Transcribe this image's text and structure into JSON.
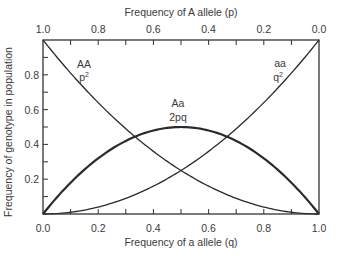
{
  "chart_data": {
    "type": "line",
    "title": "",
    "xlabel": "Frequency of a allele (q)",
    "x2label": "Frequency of A allele (p)",
    "ylabel": "Frequency of genotype in population",
    "xlim": [
      0,
      1
    ],
    "ylim": [
      0,
      1
    ],
    "x_ticks": [
      "0.0",
      "0.2",
      "0.4",
      "0.6",
      "0.8",
      "1.0"
    ],
    "x2_ticks": [
      "1.0",
      "0.8",
      "0.6",
      "0.4",
      "0.2",
      "0.0"
    ],
    "y_ticks": [
      "0.2",
      "0.4",
      "0.6",
      "0.8"
    ],
    "grid": false,
    "x": [
      0,
      0.1,
      0.2,
      0.3,
      0.4,
      0.5,
      0.6,
      0.7,
      0.8,
      0.9,
      1.0
    ],
    "series": [
      {
        "name": "AA p²",
        "label_top": "AA",
        "label_bottom": "p2",
        "values": [
          1.0,
          0.81,
          0.64,
          0.49,
          0.36,
          0.25,
          0.16,
          0.09,
          0.04,
          0.01,
          0.0
        ]
      },
      {
        "name": "Aa 2pq",
        "label_top": "Aa",
        "label_bottom": "2pq",
        "values": [
          0.0,
          0.18,
          0.32,
          0.42,
          0.48,
          0.5,
          0.48,
          0.42,
          0.32,
          0.18,
          0.0
        ]
      },
      {
        "name": "aa q²",
        "label_top": "aa",
        "label_bottom": "q2",
        "values": [
          0.0,
          0.01,
          0.04,
          0.09,
          0.16,
          0.25,
          0.36,
          0.49,
          0.64,
          0.81,
          1.0
        ]
      }
    ]
  }
}
